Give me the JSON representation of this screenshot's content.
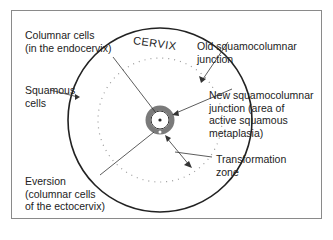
{
  "diagram": {
    "title": "CERVIX",
    "labels": {
      "columnar_cells": "Columnar cells\n(in the endocervix)",
      "squamous_cells": "Squamous\ncells",
      "eversion": "Eversion\n(columnar cells\nof the ectocervix)",
      "old_scj": "Old squamocolumnar\njunction",
      "new_scj": "New squamocolumnar\njunction (area of\nactive squamous\nmetaplasia)",
      "transformation_zone": "Transformation\nzone"
    },
    "colors": {
      "line": "#222222",
      "ring": "#7a7a7a",
      "dots": "#888888",
      "frame": "#8a8a8a"
    }
  }
}
